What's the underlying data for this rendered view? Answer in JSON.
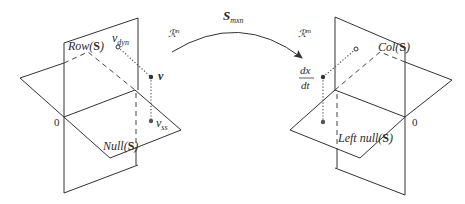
{
  "arrow": {
    "label_main": "S",
    "label_sub": "mxn",
    "domain_label": "ℛ",
    "domain_sup": "n",
    "codomain_label": "ℛ",
    "codomain_sup": "m"
  },
  "left_diagram": {
    "row_space_label": "Row(",
    "row_space_arg": "S",
    "null_space_label": "Null(",
    "null_space_arg": "S",
    "origin_label": "0",
    "v_dyn": "v",
    "v_dyn_sub": "dyn",
    "v": "v",
    "v_ss": "v",
    "v_ss_sub": "ss"
  },
  "right_diagram": {
    "col_space_label": "Col(",
    "col_space_arg": "S",
    "left_null_label": "Left null(",
    "left_null_arg": "S",
    "origin_label": "0",
    "dxdt_num": "dx",
    "dxdt_den": "dt"
  },
  "close_paren": ")",
  "colors": {
    "line": "#333333",
    "background": "#ffffff"
  }
}
